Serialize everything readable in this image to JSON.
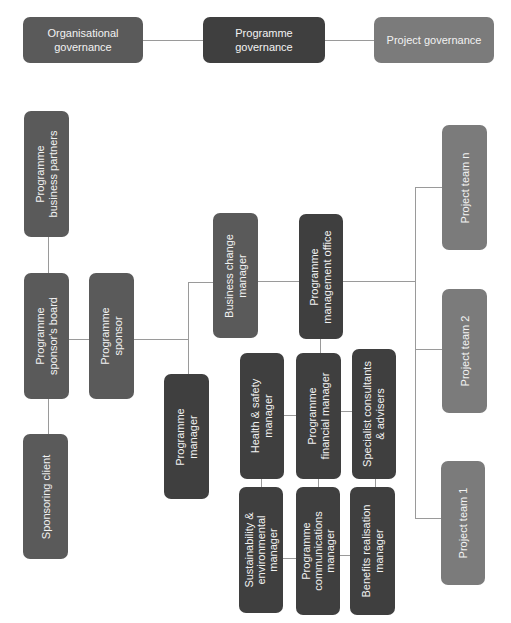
{
  "governance": {
    "organisational": "Organisational governance",
    "programme": "Programme governance",
    "project": "Project governance"
  },
  "left": {
    "business_partners": "Programme\nbusiness partners",
    "sponsors_board": "Programme\nsponsor's board",
    "sponsoring_client": "Sponsoring client",
    "sponsor": "Programme\nsponsor"
  },
  "centre": {
    "business_change_manager": "Business change\nmanager",
    "programme_management_office": "Programme\nmanagement office",
    "programme_manager": "Programme\nmanager",
    "health_safety": "Health & safety\nmanager",
    "financial_manager": "Programme\nfinancial manager",
    "specialist_consultants": "Specialist consultants\n& advisers",
    "sustainability": "Sustainability &\nenvironmental\nmanager",
    "communications": "Programme\ncommunications\nmanager",
    "benefits": "Benefits realisation\nmanager"
  },
  "projects": {
    "team_n": "Project team n",
    "team_2": "Project team 2",
    "team_1": "Project team 1"
  },
  "colors": {
    "dark": "#3f3f3f",
    "mid": "#5a5a5a",
    "light": "#7b7b7b",
    "connector": "#9a9a9a"
  }
}
